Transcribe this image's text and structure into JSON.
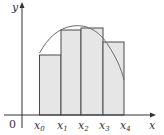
{
  "diagram": {
    "type": "riemann-sum",
    "axes": {
      "x_label": "x",
      "y_label": "y",
      "origin_label": "0"
    },
    "partition_labels": [
      {
        "base": "x",
        "sub": "0"
      },
      {
        "base": "x",
        "sub": "1"
      },
      {
        "base": "x",
        "sub": "2"
      },
      {
        "base": "x",
        "sub": "3"
      },
      {
        "base": "x",
        "sub": "4"
      }
    ],
    "rectangles": [
      {
        "from": "x0",
        "to": "x1",
        "height_rel": 0.51
      },
      {
        "from": "x1",
        "to": "x2",
        "height_rel": 0.75
      },
      {
        "from": "x2",
        "to": "x3",
        "height_rel": 0.77
      },
      {
        "from": "x3",
        "to": "x4",
        "height_rel": 0.63
      }
    ],
    "curve": "concave-down arc rising from x0, peaking between x1 and x2, falling steeply toward x4",
    "colors": {
      "rect_fill": "#e6e6e6",
      "rect_stroke": "#4a4a4a",
      "curve": "#6a6a6a",
      "axis": "#333333"
    }
  }
}
